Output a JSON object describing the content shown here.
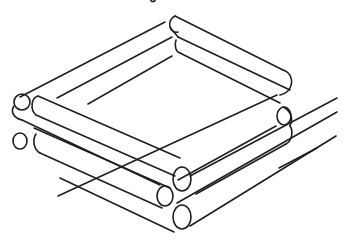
{
  "image": {
    "description": "Hand-drawn line sketch of a square frame made of stacked logs, shown in isometric view",
    "stroke_color": "#1e1e1e",
    "background_color": "#ffffff"
  }
}
